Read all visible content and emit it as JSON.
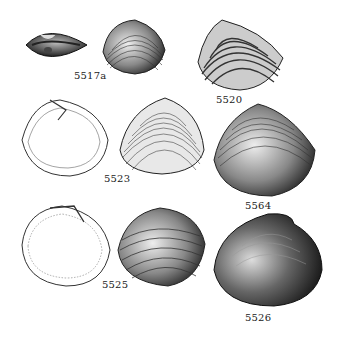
{
  "plate": {
    "figures": [
      {
        "id": "5517a",
        "label": "5517a",
        "view": "dorsal view of closed valves",
        "style": "dark engraving"
      },
      {
        "id": "5517b",
        "label": "",
        "view": "exterior of valve",
        "style": "concentric ribs"
      },
      {
        "id": "5520",
        "label": "5520",
        "view": "exterior of valve",
        "style": "strong concentric ribs"
      },
      {
        "id": "5523-int",
        "label": "5523",
        "view": "interior of valve",
        "style": "outline drawing"
      },
      {
        "id": "5523-ext",
        "label": "",
        "view": "exterior of valve",
        "style": "fine concentric lines"
      },
      {
        "id": "5564",
        "label": "5564",
        "view": "exterior of valve",
        "style": "shaded concentric lines"
      },
      {
        "id": "5525-int",
        "label": "5525",
        "view": "interior of valve",
        "style": "outline drawing with crenulated margin"
      },
      {
        "id": "5525-ext",
        "label": "",
        "view": "exterior of valve",
        "style": "concentric ribs"
      },
      {
        "id": "5526",
        "label": "5526",
        "view": "exterior of valve",
        "style": "heavily shaded"
      }
    ]
  },
  "colors": {
    "ink": "#1a1a1a",
    "paper": "#ffffff"
  }
}
